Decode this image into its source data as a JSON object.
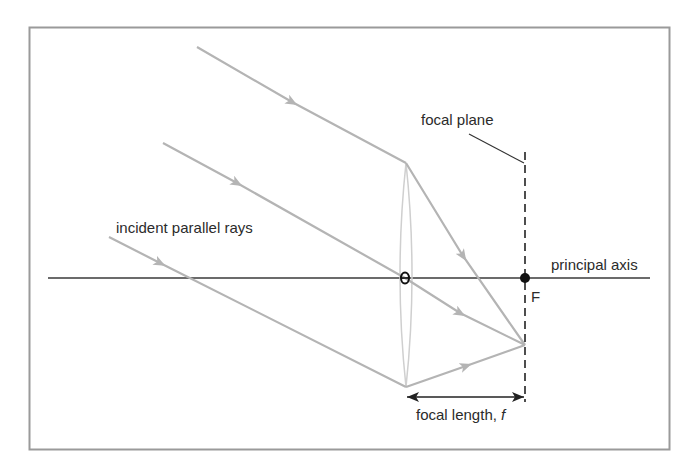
{
  "diagram": {
    "colors": {
      "frame": "#9a9a9a",
      "ray": "#b4b4b4",
      "lens": "#cfcfcf",
      "axis": "#3a3a3a",
      "text": "#2b2b2b",
      "focal_point": "#111111"
    },
    "labels": {
      "incident_rays": "incident parallel rays",
      "focal_plane": "focal plane",
      "principal_axis": "principal axis",
      "focal_point": "F",
      "focal_length_prefix": "focal length, ",
      "focal_length_symbol": "f"
    },
    "elements": {
      "frame": {
        "x": 29,
        "y": 27,
        "w": 640,
        "h": 422
      },
      "principal_axis": {
        "x1": 48,
        "y": 278,
        "x2": 650
      },
      "lens": {
        "cx": 406,
        "top": 163,
        "bottom": 387,
        "half_width": 8
      },
      "lens_center": {
        "x": 405,
        "y": 278
      },
      "focal_point": {
        "x": 525,
        "y": 278
      },
      "convergence_point": {
        "x": 525,
        "y": 345
      },
      "focal_plane": {
        "x": 525,
        "y1": 152,
        "y2": 402
      },
      "focal_plane_leader": {
        "x1": 469,
        "y1": 134,
        "x2": 525,
        "y2": 163
      },
      "focal_length_arrow": {
        "x1": 406,
        "x2": 525,
        "y": 397
      },
      "rays": [
        {
          "name": "upper-ray",
          "start": [
            197,
            47
          ],
          "lens_hit": [
            406,
            163
          ],
          "end": [
            525,
            345
          ]
        },
        {
          "name": "central-ray",
          "start": [
            163,
            143
          ],
          "lens_hit": [
            405,
            278
          ],
          "end": [
            525,
            345
          ]
        },
        {
          "name": "lower-ray",
          "start": [
            109,
            237
          ],
          "lens_hit": [
            406,
            387
          ],
          "end": [
            525,
            345
          ]
        }
      ]
    }
  }
}
